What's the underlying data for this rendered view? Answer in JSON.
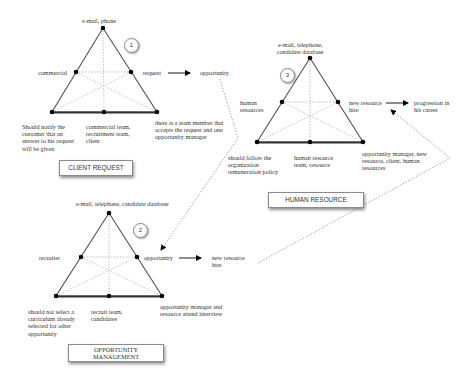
{
  "colors": {
    "background": "#ffffff",
    "line": "#555555",
    "dotted": "#999999",
    "node": "#000000",
    "text": "#333333"
  },
  "diagrams": [
    {
      "id": "client-request",
      "number": "1",
      "title": "CLIENT REQUEST",
      "top": "e-mail, phone",
      "left": "commercial",
      "right": "request",
      "arrow_target": "opportunity",
      "bottom_left": "Should notify the\ncustomer that an\nanswer to his request\nwill be given",
      "bottom_center": "commercial team,\nrecruitment team,\nclient",
      "bottom_right": "there is a team member that\naccepts the request and one\nopportunity manager"
    },
    {
      "id": "opportunity-management",
      "number": "2",
      "title": "OPPORTUNITY\nMANAGEMENT",
      "top": "e-mail, telephone, candidate database",
      "left": "recruiter",
      "right": "opportunity",
      "arrow_target": "new resource\nhire",
      "bottom_left": "should not select a\ncurriculum already\nselected for other\nopportunity",
      "bottom_center": "recruit team,\ncandidates",
      "bottom_right": "opportunity manager and\nresource attend interview"
    },
    {
      "id": "human-resource",
      "number": "3",
      "title": "HUMAN RESOURCE",
      "top": "e-mail, telephone,\ncandidate database",
      "left": "human\nresources",
      "right": "new resource\nhire",
      "arrow_target": "progression in\nhis career",
      "bottom_left": "should follow the\norganization\nremuneration policy",
      "bottom_center": "human resource\nteam, resource",
      "bottom_right": "opportunity manager, new\nresource, client, human\nresources"
    }
  ]
}
